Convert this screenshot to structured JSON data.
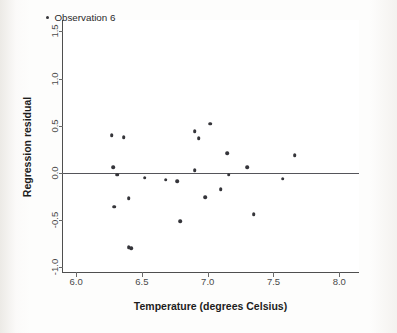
{
  "chart_data": {
    "type": "scatter",
    "title": "",
    "xlabel": "Temperature (degrees Celsius)",
    "ylabel": "Regression residual",
    "xlim": [
      5.9,
      8.15
    ],
    "ylim": [
      -1.05,
      1.62
    ],
    "xticks": [
      6.0,
      6.5,
      7.0,
      7.5,
      8.0
    ],
    "xtick_labels": [
      "6.0",
      "6.5",
      "7.0",
      "7.5",
      "8.0"
    ],
    "yticks": [
      -1.0,
      -0.5,
      0.0,
      0.5,
      1.0,
      1.5
    ],
    "ytick_labels": [
      "-1.0",
      "-0.5",
      "0.0",
      "0.5",
      "1.0",
      "1.5"
    ],
    "grid": false,
    "reference_line": {
      "axis": "horizontal",
      "value": 0.0,
      "color": "#55555a"
    },
    "marker_color": "#35353a",
    "legend": {
      "position": "top-left-inside",
      "entries": [
        {
          "label": "Observation 6",
          "marker": "dot",
          "color": "#35353a"
        }
      ]
    },
    "points": [
      {
        "x": 6.27,
        "y": 0.4
      },
      {
        "x": 6.36,
        "y": 0.38
      },
      {
        "x": 6.28,
        "y": 0.06
      },
      {
        "x": 6.31,
        "y": -0.02
      },
      {
        "x": 6.29,
        "y": -0.36
      },
      {
        "x": 6.4,
        "y": -0.27
      },
      {
        "x": 6.4,
        "y": -0.79
      },
      {
        "x": 6.42,
        "y": -0.8
      },
      {
        "x": 6.52,
        "y": -0.05
      },
      {
        "x": 6.68,
        "y": -0.07
      },
      {
        "x": 6.77,
        "y": -0.09
      },
      {
        "x": 6.79,
        "y": -0.51
      },
      {
        "x": 6.9,
        "y": 0.44
      },
      {
        "x": 6.9,
        "y": 0.03
      },
      {
        "x": 6.93,
        "y": 0.37
      },
      {
        "x": 6.98,
        "y": -0.26
      },
      {
        "x": 7.02,
        "y": 0.52
      },
      {
        "x": 7.1,
        "y": -0.17
      },
      {
        "x": 7.15,
        "y": 0.21
      },
      {
        "x": 7.16,
        "y": -0.02
      },
      {
        "x": 7.3,
        "y": 0.06
      },
      {
        "x": 7.35,
        "y": -0.44
      },
      {
        "x": 7.57,
        "y": -0.06
      },
      {
        "x": 7.66,
        "y": 0.19
      }
    ]
  }
}
